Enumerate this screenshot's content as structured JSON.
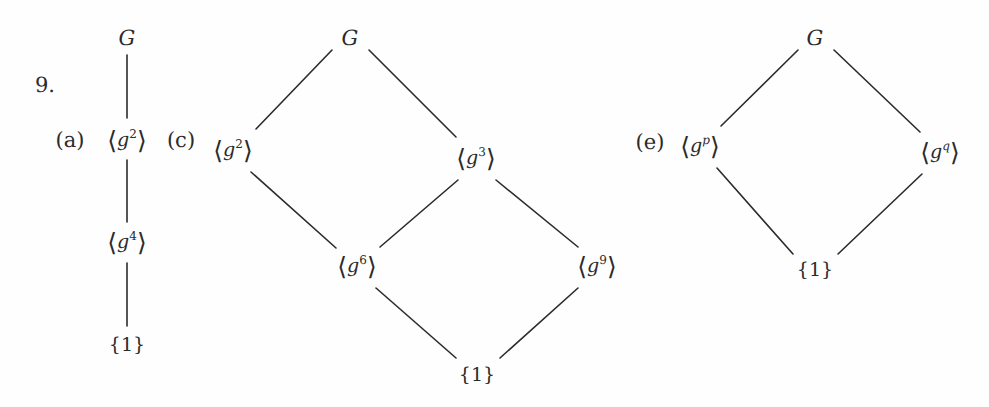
{
  "page": {
    "exercise_number": "9.",
    "background_color": "#fefefe",
    "ink_color": "#2b2b2b",
    "width": 989,
    "height": 407
  },
  "part_labels": {
    "a": "(a)",
    "c": "(c)",
    "e": "(e)"
  },
  "diagrams": [
    {
      "id": "lattice-a",
      "part": "(a)",
      "nodes": [
        {
          "id": "a-top",
          "label": "G",
          "base": "G",
          "exponent": "",
          "kind": "plain",
          "x": 127,
          "y": 38
        },
        {
          "id": "a-g2",
          "label": "⟨g²⟩",
          "base": "g",
          "exponent": "2",
          "kind": "gen",
          "x": 127,
          "y": 140
        },
        {
          "id": "a-g4",
          "label": "⟨g⁴⟩",
          "base": "g",
          "exponent": "4",
          "kind": "gen",
          "x": 127,
          "y": 242
        },
        {
          "id": "a-one",
          "label": "{1}",
          "base": "",
          "exponent": "",
          "kind": "triv",
          "x": 127,
          "y": 345
        }
      ],
      "edges": [
        {
          "from": "a-top",
          "to": "a-g2",
          "x1": 127,
          "y1": 55,
          "x2": 127,
          "y2": 118
        },
        {
          "from": "a-g2",
          "to": "a-g4",
          "x1": 127,
          "y1": 160,
          "x2": 127,
          "y2": 222
        },
        {
          "from": "a-g4",
          "to": "a-one",
          "x1": 127,
          "y1": 263,
          "x2": 127,
          "y2": 326
        }
      ]
    },
    {
      "id": "lattice-c",
      "part": "(c)",
      "nodes": [
        {
          "id": "c-top",
          "label": "G",
          "base": "G",
          "exponent": "",
          "kind": "plain",
          "x": 350,
          "y": 38
        },
        {
          "id": "c-g2",
          "label": "⟨g²⟩",
          "base": "g",
          "exponent": "2",
          "kind": "gen",
          "x": 233,
          "y": 150
        },
        {
          "id": "c-g3",
          "label": "⟨g³⟩",
          "base": "g",
          "exponent": "3",
          "kind": "gen",
          "x": 476,
          "y": 158
        },
        {
          "id": "c-g6",
          "label": "⟨g⁶⟩",
          "base": "g",
          "exponent": "6",
          "kind": "gen",
          "x": 357,
          "y": 266
        },
        {
          "id": "c-g9",
          "label": "⟨g⁹⟩",
          "base": "g",
          "exponent": "9",
          "kind": "gen",
          "x": 597,
          "y": 266
        },
        {
          "id": "c-one",
          "label": "{1}",
          "base": "",
          "exponent": "",
          "kind": "triv",
          "x": 477,
          "y": 375
        }
      ],
      "edges": [
        {
          "from": "c-top",
          "to": "c-g2",
          "x1": 332,
          "y1": 50,
          "x2": 256,
          "y2": 129
        },
        {
          "from": "c-top",
          "to": "c-g3",
          "x1": 369,
          "y1": 50,
          "x2": 456,
          "y2": 137
        },
        {
          "from": "c-g2",
          "to": "c-g6",
          "x1": 251,
          "y1": 172,
          "x2": 336,
          "y2": 248
        },
        {
          "from": "c-g3",
          "to": "c-g6",
          "x1": 458,
          "y1": 180,
          "x2": 380,
          "y2": 247
        },
        {
          "from": "c-g3",
          "to": "c-g9",
          "x1": 496,
          "y1": 180,
          "x2": 578,
          "y2": 247
        },
        {
          "from": "c-g6",
          "to": "c-one",
          "x1": 376,
          "y1": 288,
          "x2": 456,
          "y2": 358
        },
        {
          "from": "c-g9",
          "to": "c-one",
          "x1": 578,
          "y1": 288,
          "x2": 500,
          "y2": 358
        }
      ]
    },
    {
      "id": "lattice-e",
      "part": "(e)",
      "nodes": [
        {
          "id": "e-top",
          "label": "G",
          "base": "G",
          "exponent": "",
          "kind": "plain",
          "x": 815,
          "y": 38
        },
        {
          "id": "e-gp",
          "label": "⟨gᵖ⟩",
          "base": "g",
          "exponent": "p",
          "kind": "gen",
          "x": 700,
          "y": 146
        },
        {
          "id": "e-gq",
          "label": "⟨gᑫ⟩",
          "base": "g",
          "exponent": "q",
          "kind": "gen",
          "x": 940,
          "y": 152
        },
        {
          "id": "e-one",
          "label": "{1}",
          "base": "",
          "exponent": "",
          "kind": "triv",
          "x": 815,
          "y": 270
        }
      ],
      "edges": [
        {
          "from": "e-top",
          "to": "e-gp",
          "x1": 798,
          "y1": 50,
          "x2": 721,
          "y2": 126
        },
        {
          "from": "e-top",
          "to": "e-gq",
          "x1": 834,
          "y1": 50,
          "x2": 920,
          "y2": 132
        },
        {
          "from": "e-gp",
          "to": "e-one",
          "x1": 717,
          "y1": 168,
          "x2": 793,
          "y2": 254
        },
        {
          "from": "e-gq",
          "to": "e-one",
          "x1": 922,
          "y1": 174,
          "x2": 838,
          "y2": 254
        }
      ]
    }
  ]
}
